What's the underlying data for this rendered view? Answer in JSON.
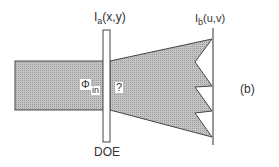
{
  "labels": {
    "input_plane": {
      "main": "I",
      "sub": "a",
      "rest": "(x,y)"
    },
    "output_plane": {
      "main": "I",
      "sub": "b",
      "rest": "(u,v)"
    },
    "phase_in": {
      "main": "Φ",
      "sub": "in"
    },
    "unknown": "?",
    "element": "DOE",
    "panel": "(b)"
  },
  "colors": {
    "beam_fill": "#bdbdbd",
    "stroke": "#444444"
  }
}
